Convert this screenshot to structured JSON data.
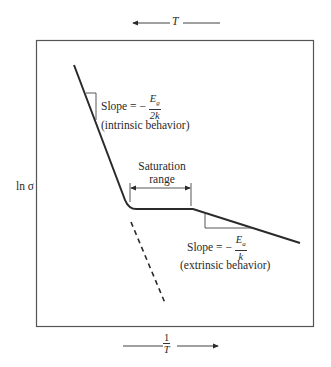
{
  "diagram": {
    "top_axis": {
      "label": "T",
      "arrow_direction": "left"
    },
    "bottom_axis": {
      "label_num": "1",
      "label_den": "T",
      "arrow_direction": "right"
    },
    "y_axis_label": "ln σ",
    "regions": {
      "intrinsic": {
        "slope_prefix": "Slope = −",
        "slope_num": "E",
        "slope_num_sub": "g",
        "slope_den": "2k",
        "caption": "(intrinsic behavior)"
      },
      "saturation": {
        "line1": "Saturation",
        "line2": "range"
      },
      "extrinsic": {
        "slope_prefix": "Slope = −",
        "slope_num": "E",
        "slope_num_sub": "a",
        "slope_den": "k",
        "caption": "(extrinsic behavior)"
      }
    },
    "colors": {
      "line": "#2a2a2a",
      "frame": "#555555",
      "background": "#ffffff"
    }
  }
}
